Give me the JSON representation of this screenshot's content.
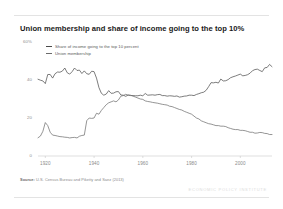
{
  "chart_data": {
    "type": "line",
    "title": "Union membership and share of income going to the top 10%",
    "xlabel": "",
    "ylabel": "",
    "xlim": [
      1917,
      2013
    ],
    "ylim": [
      0,
      60
    ],
    "grid": false,
    "legend_position": "top-left",
    "x_ticks": [
      "1920",
      "1940",
      "1960",
      "1980",
      "2000"
    ],
    "x_tick_values": [
      1920,
      1940,
      1960,
      1980,
      2000
    ],
    "y_ticks": [
      "60%",
      "40",
      "20",
      "0"
    ],
    "y_tick_values": [
      60,
      40,
      20,
      0
    ],
    "source": "U.S. Census Bureau and Piketty and Saez (2013)",
    "source_label": "Source:",
    "watermark": "ECONOMIC POLICY INSTITUTE",
    "series": [
      {
        "name": "Share of income going to the top 10 percent",
        "color": "#4a4a4a",
        "x": [
          1917,
          1918,
          1919,
          1920,
          1921,
          1922,
          1923,
          1924,
          1925,
          1926,
          1927,
          1928,
          1929,
          1930,
          1931,
          1932,
          1933,
          1934,
          1935,
          1936,
          1937,
          1938,
          1939,
          1940,
          1941,
          1942,
          1943,
          1944,
          1945,
          1946,
          1947,
          1948,
          1949,
          1950,
          1951,
          1952,
          1953,
          1954,
          1955,
          1956,
          1957,
          1958,
          1959,
          1960,
          1961,
          1962,
          1963,
          1964,
          1965,
          1966,
          1967,
          1968,
          1969,
          1970,
          1971,
          1972,
          1973,
          1974,
          1975,
          1976,
          1977,
          1978,
          1979,
          1980,
          1981,
          1982,
          1983,
          1984,
          1985,
          1986,
          1987,
          1988,
          1989,
          1990,
          1991,
          1992,
          1993,
          1994,
          1995,
          1996,
          1997,
          1998,
          1999,
          2000,
          2001,
          2002,
          2003,
          2004,
          2005,
          2006,
          2007,
          2008,
          2009,
          2010,
          2011,
          2012,
          2013
        ],
        "values": [
          40.4,
          39.9,
          39.5,
          38.1,
          42.9,
          42.9,
          41.0,
          43.3,
          44.2,
          44.1,
          44.7,
          46.3,
          43.8,
          43.1,
          44.4,
          46.3,
          45.0,
          45.2,
          43.4,
          44.8,
          43.3,
          43.0,
          44.6,
          44.4,
          41.0,
          36.0,
          33.0,
          32.0,
          32.6,
          34.4,
          33.0,
          33.1,
          33.8,
          33.9,
          32.1,
          32.0,
          31.4,
          32.1,
          31.8,
          31.8,
          31.7,
          31.7,
          32.0,
          31.7,
          32.9,
          32.0,
          32.1,
          32.2,
          32.0,
          32.3,
          32.4,
          31.8,
          31.8,
          31.5,
          31.7,
          31.6,
          31.4,
          31.6,
          31.0,
          31.2,
          31.5,
          31.6,
          32.0,
          32.0,
          31.8,
          32.4,
          32.8,
          33.3,
          33.6,
          34.6,
          36.5,
          38.6,
          38.5,
          38.8,
          38.4,
          40.5,
          39.5,
          39.6,
          40.2,
          41.2,
          41.7,
          42.1,
          42.6,
          43.1,
          42.2,
          42.4,
          42.8,
          43.6,
          44.9,
          45.5,
          45.7,
          45.0,
          44.4,
          46.4,
          46.6,
          48.2,
          47.0
        ]
      },
      {
        "name": "Union membership",
        "color": "#6b6b6b",
        "x": [
          1917,
          1918,
          1919,
          1920,
          1921,
          1922,
          1923,
          1924,
          1925,
          1926,
          1927,
          1928,
          1929,
          1930,
          1931,
          1932,
          1933,
          1934,
          1935,
          1936,
          1937,
          1938,
          1939,
          1940,
          1941,
          1942,
          1943,
          1944,
          1945,
          1946,
          1947,
          1948,
          1949,
          1950,
          1951,
          1952,
          1953,
          1954,
          1955,
          1956,
          1957,
          1958,
          1959,
          1960,
          1961,
          1962,
          1963,
          1964,
          1965,
          1966,
          1967,
          1968,
          1969,
          1970,
          1971,
          1972,
          1973,
          1974,
          1975,
          1976,
          1977,
          1978,
          1979,
          1980,
          1981,
          1982,
          1983,
          1984,
          1985,
          1986,
          1987,
          1988,
          1989,
          1990,
          1991,
          1992,
          1993,
          1994,
          1995,
          1996,
          1997,
          1998,
          1999,
          2000,
          2001,
          2002,
          2003,
          2004,
          2005,
          2006,
          2007,
          2008,
          2009,
          2010,
          2011,
          2012,
          2013
        ],
        "values": [
          9.6,
          10.5,
          13.0,
          17.6,
          16.0,
          12.5,
          11.0,
          10.8,
          10.5,
          10.2,
          10.1,
          9.9,
          9.8,
          9.5,
          9.7,
          9.8,
          9.5,
          10.4,
          10.8,
          11.0,
          18.6,
          20.0,
          19.8,
          20.0,
          22.5,
          22.0,
          24.0,
          25.5,
          27.0,
          28.0,
          28.5,
          29.0,
          28.5,
          29.5,
          31.5,
          31.8,
          32.5,
          32.0,
          32.0,
          31.5,
          31.0,
          30.5,
          30.0,
          29.8,
          29.0,
          28.7,
          28.5,
          28.2,
          28.0,
          27.8,
          27.5,
          27.2,
          27.0,
          26.8,
          26.2,
          26.0,
          25.5,
          25.0,
          24.5,
          24.2,
          23.5,
          23.0,
          22.5,
          22.0,
          21.0,
          20.0,
          19.5,
          18.5,
          18.0,
          17.5,
          17.0,
          16.8,
          16.4,
          16.0,
          16.0,
          15.7,
          15.7,
          15.5,
          14.9,
          14.5,
          14.1,
          13.9,
          13.9,
          13.5,
          13.5,
          13.3,
          12.9,
          12.5,
          12.5,
          12.0,
          12.1,
          12.4,
          12.3,
          11.9,
          11.8,
          11.3,
          11.3
        ]
      }
    ]
  }
}
